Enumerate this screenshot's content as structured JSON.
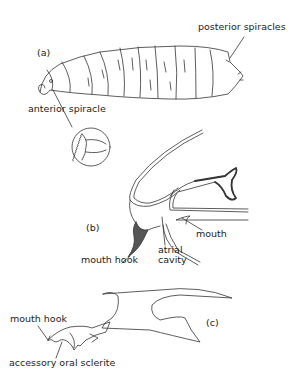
{
  "figure": {
    "panels": [
      {
        "id": "a",
        "label": "(a)",
        "subject": "larva whole body"
      },
      {
        "id": "b",
        "label": "(b)",
        "subject": "head region section"
      },
      {
        "id": "c",
        "label": "(c)",
        "subject": "cephalopharyngeal skeleton"
      }
    ],
    "labels": {
      "posterior_spiracles": "posterior spiracles",
      "anterior_spiracle": "anterior spiracle",
      "mouth": "mouth",
      "mouth_hook_b": "mouth hook",
      "atrial_cavity_1": "atrial",
      "atrial_cavity_2": "cavity",
      "mouth_hook_c": "mouth hook",
      "accessory_oral_sclerite": "accessory oral sclerite"
    },
    "colors": {
      "line": "#333333",
      "background": "#ffffff"
    }
  }
}
